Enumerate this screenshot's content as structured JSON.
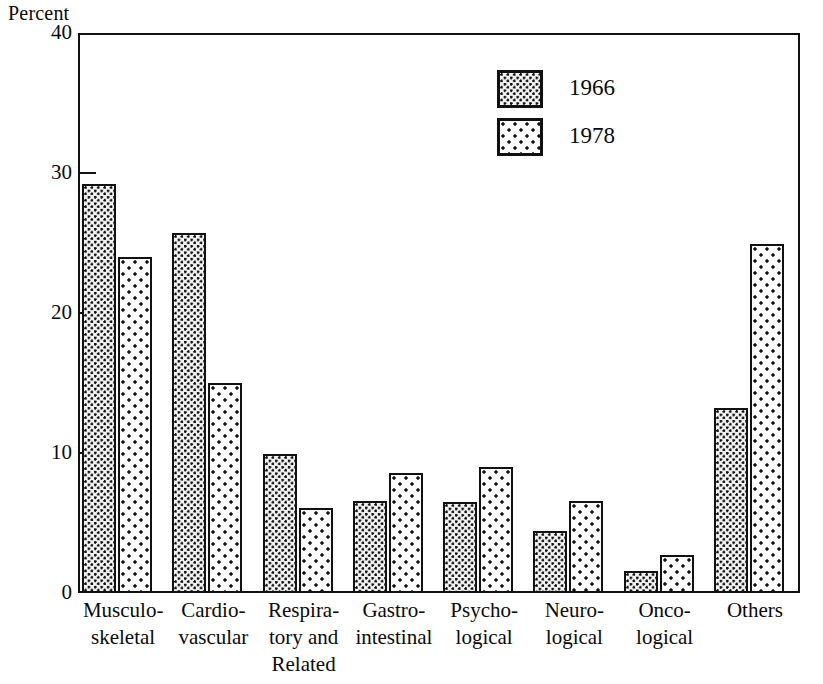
{
  "chart_data": {
    "type": "bar",
    "title": "",
    "subtitle": "",
    "xlabel": "",
    "ylabel": "Percent",
    "ylim": [
      0,
      40
    ],
    "yticks": [
      0,
      10,
      20,
      30,
      40
    ],
    "ytick_labels": [
      "0",
      "10",
      "20",
      "30",
      "40"
    ],
    "grid": false,
    "legend_position": "top-right",
    "categories": [
      "Musculo-skeletal",
      "Cardio-vascular",
      "Respiratory and Related",
      "Gastro-intestinal",
      "Psycho-logical",
      "Neuro-logical",
      "Onco-logical",
      "Others"
    ],
    "category_lines": [
      [
        "Musculo-",
        "skeletal"
      ],
      [
        "Cardio-",
        "vascular"
      ],
      [
        "Respira-",
        "tory and",
        "Related"
      ],
      [
        "Gastro-",
        "intestinal"
      ],
      [
        "Psycho-",
        "logical"
      ],
      [
        "Neuro-",
        "logical"
      ],
      [
        "Onco-",
        "logical"
      ],
      [
        "Others"
      ]
    ],
    "series": [
      {
        "name": "1966",
        "values": [
          29.2,
          25.7,
          9.9,
          6.6,
          6.5,
          4.4,
          1.6,
          13.2
        ]
      },
      {
        "name": "1978",
        "values": [
          24.0,
          15.0,
          6.1,
          8.6,
          9.0,
          6.6,
          2.7,
          24.9
        ]
      }
    ]
  },
  "axis": {
    "y_title": "Percent"
  },
  "legend": {
    "entries": [
      {
        "label": "1966",
        "pattern": "dense-dot"
      },
      {
        "label": "1978",
        "pattern": "sparse-dot"
      }
    ]
  },
  "colors": {
    "ink": "#111111",
    "background": "#ffffff",
    "fill_1966": "#f2f2f2",
    "fill_1978": "#fbfbfb"
  }
}
